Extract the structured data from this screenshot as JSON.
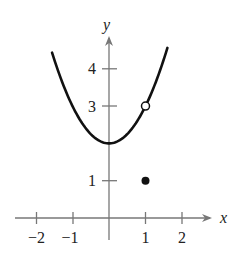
{
  "chart_data": {
    "type": "line",
    "title": "",
    "xlabel": "x",
    "ylabel": "y",
    "xlim": [
      -2.5,
      2.8
    ],
    "ylim": [
      -0.4,
      4.8
    ],
    "x_ticks": [
      -2,
      -1,
      1,
      2
    ],
    "x_tick_labels": [
      "−2",
      "−1",
      "1",
      "2"
    ],
    "y_ticks": [
      1,
      3,
      4
    ],
    "y_tick_labels": [
      "1",
      "3",
      "4"
    ],
    "grid": false,
    "legend": null,
    "series": [
      {
        "name": "f(x) = x^2 + 2 (x ≠ 1)",
        "function": "x^2 + 2",
        "x_range": [
          -1.56,
          1.6
        ],
        "x": [
          -1.5,
          -1,
          -0.5,
          0,
          0.5,
          1,
          1.5
        ],
        "values": [
          4.25,
          3,
          2.25,
          2,
          2.25,
          3,
          4.25
        ]
      }
    ],
    "annotations": [
      {
        "type": "open-circle",
        "x": 1,
        "y": 3
      },
      {
        "type": "filled-point",
        "x": 1,
        "y": 1
      }
    ]
  },
  "axes": {
    "x_label": "x",
    "y_label": "y",
    "x_tick_labels": [
      "−2",
      "−1",
      "1",
      "2"
    ],
    "y_tick_labels": [
      "4",
      "3",
      "1"
    ]
  },
  "colors": {
    "curve": "#111111",
    "axis": "#777777",
    "text": "#222222"
  }
}
